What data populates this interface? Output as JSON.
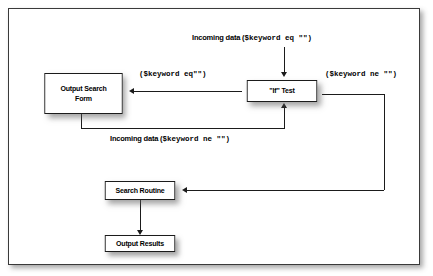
{
  "diagram": {
    "type": "flowchart",
    "title_visible": false,
    "background_color": "#ffffff",
    "border_color": "#3a3a3a",
    "node_border_color": "#1b1b1b",
    "text_color": "#000000",
    "nodes": [
      {
        "id": "output-search-form",
        "label": "Output Search\nForm"
      },
      {
        "id": "if-test",
        "label": "\"If\" Test"
      },
      {
        "id": "search-routine",
        "label": "Search Routine"
      },
      {
        "id": "output-results",
        "label": "Output Results"
      }
    ],
    "edge_labels": {
      "incoming_eq_prefix": "Incoming data (",
      "incoming_eq_code": "$keyword eq \"\")",
      "branch_eq_code": "($keyword eq\"\")",
      "branch_ne_code": "($keyword ne \"\")",
      "incoming_ne_prefix": "Incoming data (",
      "incoming_ne_code": "$keyword ne \"\")"
    }
  }
}
